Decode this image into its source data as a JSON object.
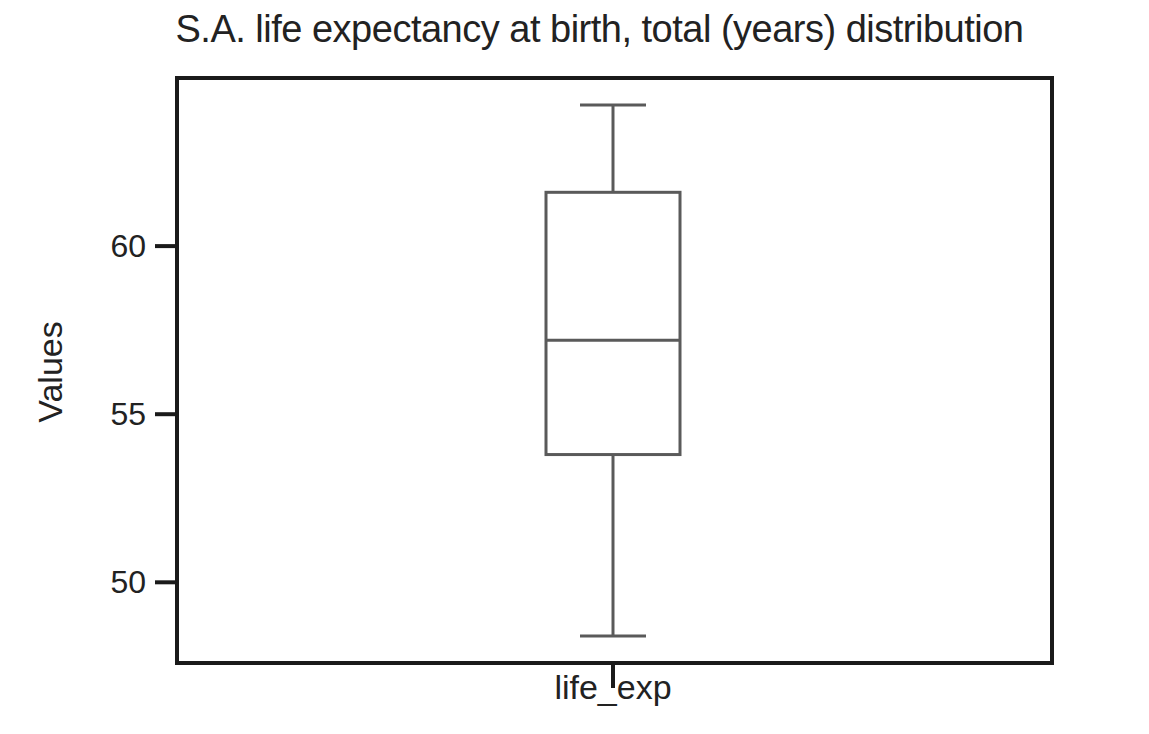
{
  "chart_data": {
    "type": "box",
    "title": "S.A. life expectancy at birth, total (years) distribution",
    "xlabel": "",
    "ylabel": "Values",
    "categories": [
      "life_exp"
    ],
    "series": [
      {
        "name": "life_exp",
        "whisker_low": 48.4,
        "q1": 53.8,
        "median": 57.2,
        "q3": 61.6,
        "whisker_high": 64.2
      }
    ],
    "yticks": [
      50,
      55,
      60
    ],
    "ylim": [
      47.6,
      65.0
    ],
    "grid": false,
    "legend": null
  },
  "labels": {
    "title": "S.A. life expectancy at birth, total (years) distribution",
    "ylabel": "Values",
    "xticks": [
      "life_exp"
    ],
    "yticks": [
      "50",
      "55",
      "60"
    ]
  },
  "colors": {
    "axes": "#1a1a1a",
    "box_line": "#5a5a5a",
    "background": "#ffffff"
  }
}
